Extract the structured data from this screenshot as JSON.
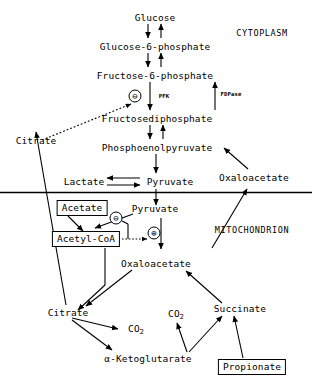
{
  "diagram": {
    "compartments": [
      {
        "id": "cytoplasm",
        "label": "CYTOPLASM"
      },
      {
        "id": "mitochondrion",
        "label": "MITOCHONDRION"
      }
    ],
    "nodes": [
      {
        "id": "glucose",
        "label": "Glucose"
      },
      {
        "id": "glucose6p",
        "label": "Glucose-6-phosphate"
      },
      {
        "id": "fructose6p",
        "label": "Fructose-6-phosphate"
      },
      {
        "id": "fdp",
        "label": "Fructosediphosphate"
      },
      {
        "id": "pep",
        "label": "Phosphoenolpyruvate"
      },
      {
        "id": "lactate",
        "label": "Lactate"
      },
      {
        "id": "pyruvate-cyto",
        "label": "Pyruvate"
      },
      {
        "id": "citrate-cyto",
        "label": "Citrate"
      },
      {
        "id": "oxaloacetate-cyto",
        "label": "Oxaloacetate"
      },
      {
        "id": "acetate",
        "label": "Acetate"
      },
      {
        "id": "pyruvate-mito",
        "label": "Pyruvate"
      },
      {
        "id": "acetyl-coa",
        "label": "Acetyl-CoA"
      },
      {
        "id": "oxaloacetate-mito",
        "label": "Oxaloacetate"
      },
      {
        "id": "citrate-mito",
        "label": "Citrate"
      },
      {
        "id": "succinate",
        "label": "Succinate"
      },
      {
        "id": "ketoglutarate",
        "label": "α-Ketoglutarate"
      },
      {
        "id": "propionate",
        "label": "Propionate"
      },
      {
        "id": "co2-left",
        "label": "CO",
        "subscript": "2"
      },
      {
        "id": "co2-right",
        "label": "CO",
        "subscript": "2"
      }
    ],
    "enzymes": [
      {
        "id": "pfk",
        "label": "PFK"
      },
      {
        "id": "fdpase",
        "label": "FDPase"
      }
    ],
    "modifiers": [
      {
        "id": "inhibition-pfk",
        "symbol": "⊖",
        "effect": "inhibition",
        "target": "PFK"
      },
      {
        "id": "inhibition-acetylcoa",
        "symbol": "⊖",
        "effect": "inhibition",
        "target": "pyruvate-dehydrogenase"
      },
      {
        "id": "activation-pc",
        "symbol": "⊕",
        "effect": "activation",
        "target": "pyruvate-carboxylase"
      }
    ],
    "colors": {
      "stroke": "#000000",
      "background": "#ffffff",
      "text": "#000000"
    }
  }
}
